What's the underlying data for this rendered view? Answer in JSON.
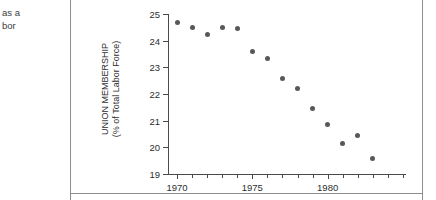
{
  "caption_fragment": {
    "line1": "as a",
    "line2": "bor"
  },
  "chart_data": {
    "type": "scatter",
    "title": "",
    "xlabel": "",
    "ylabel": "UNION MEMBERSHIP\n(% of Total Labor Force)",
    "ylabel_line1": "UNION MEMBERSHIP",
    "ylabel_line2": "(% of Total Labor Force)",
    "x": [
      1970,
      1971,
      1972,
      1973,
      1974,
      1975,
      1976,
      1977,
      1978,
      1979,
      1980,
      1981,
      1982,
      1983
    ],
    "values": [
      24.7,
      24.5,
      24.25,
      24.5,
      24.45,
      23.6,
      23.35,
      22.6,
      22.2,
      21.45,
      20.85,
      20.15,
      20.45,
      19.6
    ],
    "xlim": [
      1969.4,
      1985.2
    ],
    "ylim": [
      19,
      25
    ],
    "xticks": [
      1970,
      1971,
      1972,
      1973,
      1974,
      1975,
      1976,
      1977,
      1978,
      1979,
      1980,
      1981,
      1982,
      1983,
      1984,
      1985
    ],
    "xtick_labels": [
      {
        "value": 1970,
        "label": "1970"
      },
      {
        "value": 1975,
        "label": "1975"
      },
      {
        "value": 1980,
        "label": "1980"
      }
    ],
    "yticks": [
      19,
      20,
      21,
      22,
      23,
      24,
      25
    ],
    "ytick_labels": [
      "19",
      "20",
      "21",
      "22",
      "23",
      "24",
      "25"
    ],
    "grid": false,
    "legend": null,
    "marker_color": "#585858",
    "axis_color": "#4a4a4a"
  }
}
